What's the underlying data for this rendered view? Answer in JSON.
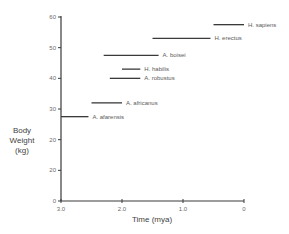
{
  "chart_data": {
    "type": "range-bar",
    "title": "",
    "xlabel": "Time (mya)",
    "ylabel": [
      "Body",
      "Weight",
      "(kg)"
    ],
    "xlim": [
      3.0,
      0
    ],
    "ylim": [
      0,
      60
    ],
    "x_ticks": [
      "3.0",
      "2.0",
      "1.0",
      "0"
    ],
    "x_tick_values": [
      3.0,
      2.0,
      1.0,
      0
    ],
    "y_ticks": [
      "0",
      "20",
      "20",
      "30",
      "40",
      "50",
      "60"
    ],
    "y_tick_values": [
      0,
      10,
      20,
      30,
      40,
      50,
      60
    ],
    "grid": false,
    "legend": "inline labels at right end of each bar",
    "series": [
      {
        "name": "A. afarensis",
        "start_mya": 3.0,
        "end_mya": 2.55,
        "weight_kg": 27.5
      },
      {
        "name": "A. africanus",
        "start_mya": 2.5,
        "end_mya": 2.0,
        "weight_kg": 32
      },
      {
        "name": "A. robustus",
        "start_mya": 2.2,
        "end_mya": 1.7,
        "weight_kg": 40
      },
      {
        "name": "H. habilis",
        "start_mya": 2.0,
        "end_mya": 1.7,
        "weight_kg": 43
      },
      {
        "name": "A. boisei",
        "start_mya": 2.3,
        "end_mya": 1.4,
        "weight_kg": 47.5
      },
      {
        "name": "H. erectus",
        "start_mya": 1.5,
        "end_mya": 0.55,
        "weight_kg": 53
      },
      {
        "name": "H. sapiens",
        "start_mya": 0.5,
        "end_mya": 0,
        "weight_kg": 57.5
      }
    ]
  },
  "colors": {
    "axis": "#3a3a3a",
    "bar": "#3a3a3a",
    "text": "#5a5a5a"
  }
}
